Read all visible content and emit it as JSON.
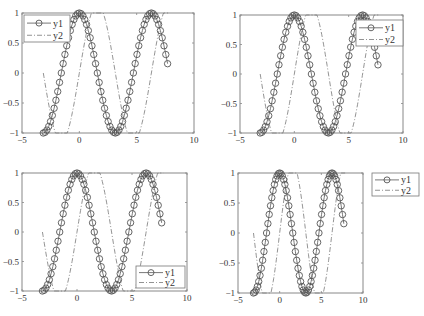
{
  "chart_data": [
    {
      "type": "line",
      "legend_location": "top-left",
      "xlim": [
        -5,
        10
      ],
      "ylim": [
        -1,
        1
      ],
      "xticks": [
        -5,
        0,
        5,
        10
      ],
      "yticks": [
        -1,
        -0.5,
        0,
        0.5,
        1
      ],
      "xtick_labels": [
        "−5",
        "0",
        "5",
        "10"
      ],
      "ytick_labels": [
        "−1",
        "−0.5",
        "0",
        "0.5",
        "1"
      ],
      "grid": false,
      "series": [
        {
          "name": "y1",
          "function": "cos(x)",
          "x_range": [
            -3.1416,
            7.854
          ],
          "step": 0.1571,
          "style": "solid line with circle markers",
          "color": "#555555"
        },
        {
          "name": "y2",
          "function": "sin(x) (saturating at axis limits)",
          "x_range": [
            -3.1416,
            7.854
          ],
          "style": "dash-dot line",
          "color": "#777777"
        }
      ]
    },
    {
      "type": "line",
      "legend_location": "top-right",
      "xlim": [
        -5,
        10
      ],
      "ylim": [
        -1,
        1
      ],
      "xticks": [
        -5,
        0,
        5,
        10
      ],
      "yticks": [
        -1,
        -0.5,
        0,
        0.5,
        1
      ],
      "xtick_labels": [
        "−5",
        "0",
        "5",
        "10"
      ],
      "ytick_labels": [
        "−1",
        "−0.5",
        "0",
        "0.5",
        "1"
      ],
      "grid": false,
      "series": [
        {
          "name": "y1",
          "function": "cos(x)",
          "x_range": [
            -3.1416,
            7.854
          ],
          "step": 0.1571,
          "style": "solid line with circle markers",
          "color": "#555555"
        },
        {
          "name": "y2",
          "function": "sin(x) (saturating at axis limits)",
          "x_range": [
            -3.1416,
            7.854
          ],
          "style": "dash-dot line",
          "color": "#777777"
        }
      ]
    },
    {
      "type": "line",
      "legend_location": "bottom-right",
      "xlim": [
        -5,
        10
      ],
      "ylim": [
        -1,
        1
      ],
      "xticks": [
        -5,
        0,
        5,
        10
      ],
      "yticks": [
        -1,
        -0.5,
        0,
        0.5,
        1
      ],
      "xtick_labels": [
        "−5",
        "0",
        "5",
        "10"
      ],
      "ytick_labels": [
        "−1",
        "−0.5",
        "0",
        "0.5",
        "1"
      ],
      "grid": false,
      "series": [
        {
          "name": "y1",
          "function": "cos(x)",
          "x_range": [
            -3.1416,
            7.854
          ],
          "step": 0.1571,
          "style": "solid line with circle markers",
          "color": "#555555"
        },
        {
          "name": "y2",
          "function": "sin(x) (saturating at axis limits)",
          "x_range": [
            -3.1416,
            7.854
          ],
          "style": "dash-dot line",
          "color": "#777777"
        }
      ]
    },
    {
      "type": "line",
      "legend_location": "outside-top-right",
      "xlim": [
        -5,
        10
      ],
      "ylim": [
        -1,
        1
      ],
      "xticks": [
        -5,
        0,
        5,
        10
      ],
      "yticks": [
        -1,
        -0.5,
        0,
        0.5,
        1
      ],
      "xtick_labels": [
        "−5",
        "0",
        "5",
        "10"
      ],
      "ytick_labels": [
        "−1",
        "−0.5",
        "0",
        "0.5",
        "1"
      ],
      "grid": false,
      "series": [
        {
          "name": "y1",
          "function": "cos(x)",
          "x_range": [
            -3.1416,
            7.854
          ],
          "step": 0.1571,
          "style": "solid line with circle markers",
          "color": "#555555"
        },
        {
          "name": "y2",
          "function": "sin(x) (saturating at axis limits)",
          "x_range": [
            -3.1416,
            7.854
          ],
          "style": "dash-dot line",
          "color": "#777777"
        }
      ]
    }
  ]
}
